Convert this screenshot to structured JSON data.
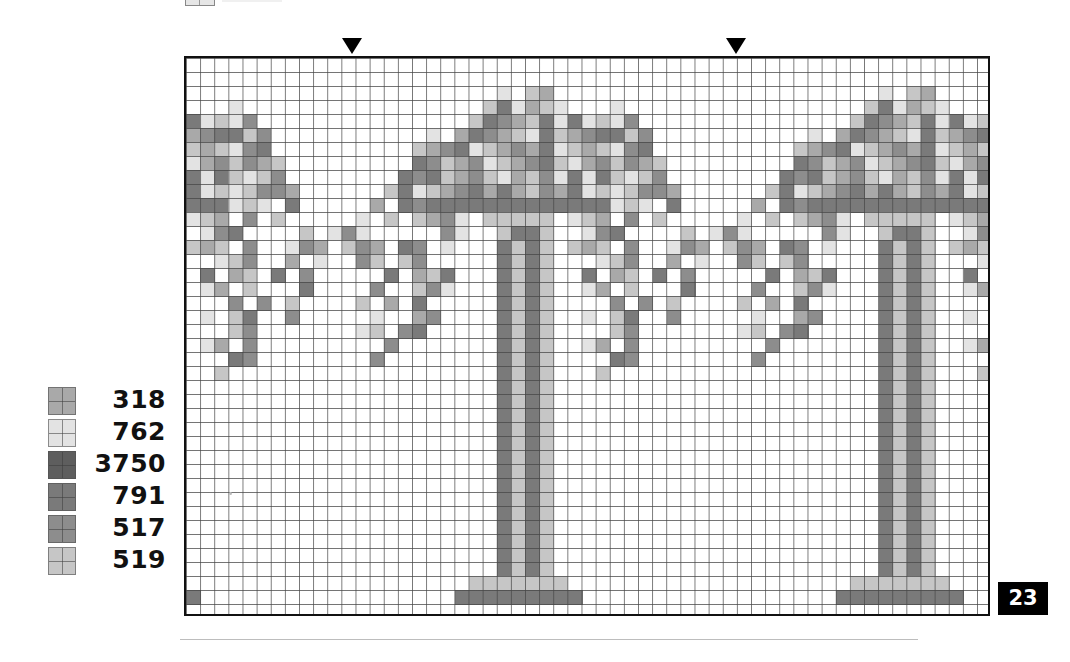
{
  "header": {
    "partial_swatch_label": ""
  },
  "markers": [
    {
      "name": "center-marker-left",
      "x": 342
    },
    {
      "name": "center-marker-right",
      "x": 726
    }
  ],
  "chart": {
    "columns": 57,
    "rows": 40,
    "cell_width": 14.14,
    "cell_height": 14,
    "repeat_width": 27,
    "tile_offsets": [
      -16,
      11,
      38
    ],
    "palette": {
      "a": {
        "code": "318",
        "color": "#a9a9a9"
      },
      "b": {
        "code": "762",
        "color": "#e3e3e3"
      },
      "c": {
        "code": "3750",
        "color": "#5e5e5e"
      },
      "d": {
        "code": "791",
        "color": "#7a7a7a"
      },
      "e": {
        "code": "517",
        "color": "#8d8d8d"
      },
      "f": {
        "code": "519",
        "color": "#c6c6c6"
      }
    },
    "tile_rows": [
      "...........................",
      "...........................",
      "...........b.fa............",
      "..........fdbafb...b.......",
      ".........fdeafdbdbfbe......",
      "......b.adeafbdfaeddfe.....",
      ".....faedbfaeadbfafbed.....",
      ".....defaebfaedfbaefeaf....",
      "....dedfaefbafebdbdfbfe....",
      "...fdbfaedadafeadbfbfeea...",
      "..a.dedddddddddddddbfb.d...",
      ".b.f.faeb.fffff.bfa.e.f....",
      "eb.....eb..fddf..bed....f.b",
      "fea.de.b...dfdf.faf.e..bea.",
      ".ef.fe.....dfdf...bfe..a.b.",
      "...d.afd...dfdf..d.af.d.e..",
      "..e..feb...dfdf..ba.f...d..",
      ".f.a.d.....dfdf....e.e.f...",
      "..b..ae....dfdf..b.fd..e...",
      ".bf.ed.....dfdf....fe......",
      "...e.......dfdf..ba.e......",
      "..e........dfdf....de......",
      "...........dfdf...f........",
      "...........dfdf............",
      "...........dfdf............",
      "...........dfdf............",
      "...........dfdf............",
      "...........dfdf............",
      "...........dfdf............",
      "...........dfdf............",
      "...........dfdf............",
      "...........dfdf............",
      "...........dfdf............",
      "...........dfdf............",
      "...........dfdf............",
      "...........dfdf............",
      "...........dfdf............",
      ".........fffffff...........",
      "........ddddddddd..........",
      "..........................."
    ],
    "extra_cells": [
      {
        "row": 38,
        "col": 0,
        "key": "d"
      }
    ]
  },
  "legend": [
    {
      "code": "318",
      "key": "a",
      "color": "#a9a9a9"
    },
    {
      "code": "762",
      "key": "b",
      "color": "#e3e3e3"
    },
    {
      "code": "3750",
      "key": "c",
      "color": "#5e5e5e"
    },
    {
      "code": "791",
      "key": "d",
      "color": "#7a7a7a"
    },
    {
      "code": "517",
      "key": "e",
      "color": "#8d8d8d"
    },
    {
      "code": "519",
      "key": "f",
      "color": "#c6c6c6"
    }
  ],
  "page": {
    "number": "23"
  }
}
